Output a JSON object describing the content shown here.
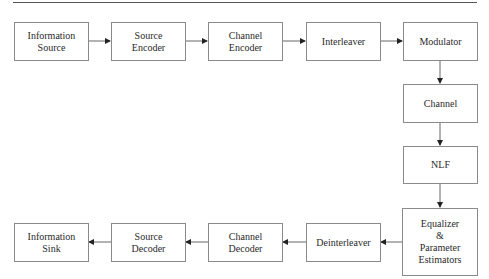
{
  "diagram": {
    "type": "block-diagram",
    "title": "",
    "blocks": [
      {
        "id": "info_source",
        "label": "Information\nSource"
      },
      {
        "id": "source_encoder",
        "label": "Source\nEncoder"
      },
      {
        "id": "channel_encoder",
        "label": "Channel\nEncoder"
      },
      {
        "id": "interleaver",
        "label": "Interleaver"
      },
      {
        "id": "modulator",
        "label": "Modulator"
      },
      {
        "id": "channel",
        "label": "Channel"
      },
      {
        "id": "nlf",
        "label": "NLF"
      },
      {
        "id": "equalizer",
        "label": "Equalizer\n&\nParameter\nEstimators"
      },
      {
        "id": "deinterleaver",
        "label": "Deinterleaver"
      },
      {
        "id": "channel_decoder",
        "label": "Channel\nDecoder"
      },
      {
        "id": "source_decoder",
        "label": "Source\nDecoder"
      },
      {
        "id": "info_sink",
        "label": "Information\nSink"
      }
    ],
    "edges": [
      [
        "info_source",
        "source_encoder"
      ],
      [
        "source_encoder",
        "channel_encoder"
      ],
      [
        "channel_encoder",
        "interleaver"
      ],
      [
        "interleaver",
        "modulator"
      ],
      [
        "modulator",
        "channel"
      ],
      [
        "channel",
        "nlf"
      ],
      [
        "nlf",
        "equalizer"
      ],
      [
        "equalizer",
        "deinterleaver"
      ],
      [
        "deinterleaver",
        "channel_decoder"
      ],
      [
        "channel_decoder",
        "source_decoder"
      ],
      [
        "source_decoder",
        "info_sink"
      ]
    ],
    "colors": {
      "border": "#8a8a8a",
      "arrow": "#555555",
      "text": "#2a2a2a"
    }
  }
}
